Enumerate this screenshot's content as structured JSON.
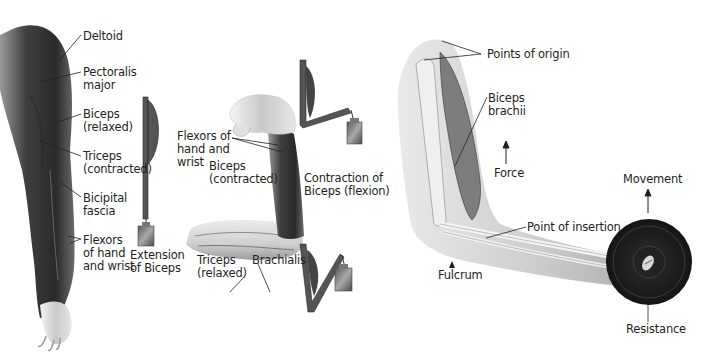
{
  "figure": {
    "panels": [
      {
        "id": "left-arm-extension",
        "labels": {
          "deltoid": "Deltoid",
          "pectoralis_1": "Pectoralis",
          "pectoralis_2": "major",
          "biceps_relaxed_1": "Biceps",
          "biceps_relaxed_2": "(relaxed)",
          "triceps_contracted_1": "Triceps",
          "triceps_contracted_2": "(contracted)",
          "bicipital_1": "Bicipital",
          "bicipital_2": "fascia",
          "flexors_1": "Flexors",
          "flexors_2": "of hand",
          "flexors_3": "and wrist",
          "caption_1": "Extension",
          "caption_2": "of Biceps"
        }
      },
      {
        "id": "middle-arm-flexion",
        "labels": {
          "flexors_1": "Flexors of",
          "flexors_2": "hand and",
          "flexors_3": "wrist",
          "biceps_contracted_1": "Biceps",
          "biceps_contracted_2": "(contracted)",
          "triceps_relaxed_1": "Triceps",
          "triceps_relaxed_2": "(relaxed)",
          "brachialis": "Brachialis",
          "caption_1": "Contraction of",
          "caption_2": "Biceps (flexion)"
        }
      },
      {
        "id": "right-arm-lever",
        "labels": {
          "origin": "Points of origin",
          "biceps_brachii_1": "Biceps",
          "biceps_brachii_2": "brachii",
          "force": "Force",
          "insertion": "Point of insertion",
          "fulcrum": "Fulcrum",
          "movement": "Movement",
          "resistance": "Resistance"
        }
      }
    ],
    "colors": {
      "text": "#231f20",
      "muscle_dark": "#3a3a3a",
      "muscle_mid": "#6b6b6b",
      "skin_light": "#d9d9d9",
      "bone": "#efefef",
      "weight_plate": "#1e1e1e"
    }
  }
}
